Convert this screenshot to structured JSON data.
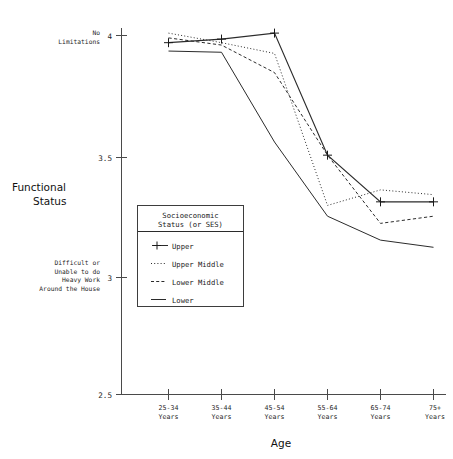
{
  "chart_data": {
    "type": "line",
    "title": "",
    "xlabel": "Age",
    "ylabel": "Functional Status",
    "categories": [
      "25-34\nYears",
      "35-44\nYears",
      "45-54\nYears",
      "55-64\nYears",
      "65-74\nYears",
      "75+\nYears"
    ],
    "x": [
      "25-34 Years",
      "35-44 Years",
      "45-54 Years",
      "55-64 Years",
      "65-74 Years",
      "75+ Years"
    ],
    "ylim": [
      2.5,
      4.05
    ],
    "yticks": [
      2.5,
      3,
      3.5,
      4
    ],
    "ytick_labels": [
      "2.5",
      "3",
      "3.5",
      "4"
    ],
    "grid": false,
    "legend_position": "center-left",
    "series": [
      {
        "name": "Upper",
        "style": "solid-with-plus-markers",
        "marker": "plus",
        "values": [
          3.97,
          3.985,
          4.01,
          3.5,
          3.305,
          3.305
        ]
      },
      {
        "name": "Upper Middle",
        "style": "dotted",
        "marker": "none",
        "values": [
          4.01,
          3.97,
          3.925,
          3.29,
          3.355,
          3.335
        ]
      },
      {
        "name": "Lower Middle",
        "style": "dashed",
        "marker": "none",
        "values": [
          3.99,
          3.96,
          3.845,
          3.5,
          3.215,
          3.245
        ]
      },
      {
        "name": "Lower",
        "style": "solid",
        "marker": "none",
        "values": [
          3.935,
          3.93,
          3.555,
          3.245,
          3.145,
          3.115
        ]
      }
    ],
    "annotations": [
      {
        "value": 4,
        "text": "No\nLimitations"
      },
      {
        "value": 3,
        "text": "Difficult or\nUnable to do\nHeavy Work\nAround the House"
      }
    ]
  },
  "axes": {
    "y_title_lines": [
      "Functional",
      "Status"
    ],
    "x_title": "Age",
    "y_tick_labels": [
      "4",
      "3.5",
      "3",
      "2.5"
    ],
    "x_tick_labels": [
      {
        "line1": "25-34",
        "line2": "Years"
      },
      {
        "line1": "35-44",
        "line2": "Years"
      },
      {
        "line1": "45-54",
        "line2": "Years"
      },
      {
        "line1": "55-64",
        "line2": "Years"
      },
      {
        "line1": "65-74",
        "line2": "Years"
      },
      {
        "line1": "75+",
        "line2": "Years"
      }
    ],
    "anno_top": [
      "No",
      "Limitations"
    ],
    "anno_bottom": [
      "Difficult or",
      "Unable to do",
      "Heavy Work",
      "Around the House"
    ]
  },
  "legend": {
    "title_line1": "Socioeconomic",
    "title_line2": "Status (or SES)",
    "entries": [
      {
        "label": "Upper",
        "style": "solid-plus"
      },
      {
        "label": "Upper Middle",
        "style": "dotted"
      },
      {
        "label": "Lower Middle",
        "style": "dashed"
      },
      {
        "label": "Lower",
        "style": "solid"
      }
    ]
  },
  "colors": {
    "line": "#2b2b2b",
    "axis": "#4a4a4a",
    "text": "#1a1a1a",
    "background": "#ffffff"
  }
}
